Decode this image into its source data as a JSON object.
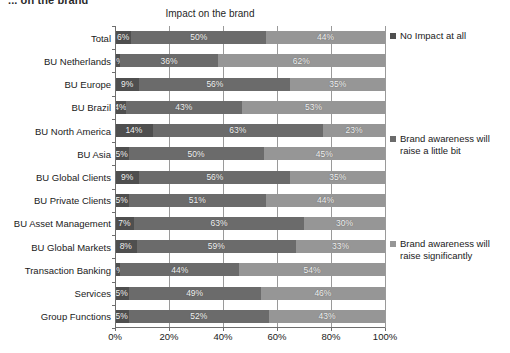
{
  "slide": {
    "header": "... on the brand"
  },
  "chart_data": {
    "type": "bar",
    "subtype": "stacked-horizontal-100",
    "title": "Impact on the brand",
    "xlabel": "",
    "ylabel": "",
    "xlim": [
      0,
      100
    ],
    "xticks": [
      "0%",
      "20%",
      "40%",
      "60%",
      "80%",
      "100%"
    ],
    "xtick_values": [
      0,
      20,
      40,
      60,
      80,
      100
    ],
    "grid": true,
    "legend_position": "right",
    "categories": [
      "Total",
      "BU Netherlands",
      "BU Europe",
      "BU Brazil",
      "BU North America",
      "BU Asia",
      "BU Global Clients",
      "BU Private Clients",
      "BU Asset Management",
      "BU Global Markets",
      "Transaction Banking",
      "Services",
      "Group Functions"
    ],
    "series": [
      {
        "name": "No Impact at all",
        "color": "#4f4f4f",
        "values": [
          6,
          2,
          9,
          4,
          14,
          5,
          9,
          5,
          7,
          8,
          2,
          5,
          5
        ],
        "labels": [
          "6%",
          "2%",
          "9%",
          "4%",
          "14%",
          "5%",
          "9%",
          "5%",
          "7%",
          "8%",
          "2%",
          "5%",
          "5%"
        ]
      },
      {
        "name": "Brand awareness will raise a little bit",
        "color": "#6b6b6b",
        "values": [
          50,
          36,
          56,
          43,
          63,
          50,
          56,
          51,
          63,
          59,
          44,
          49,
          52
        ],
        "labels": [
          "50%",
          "36%",
          "56%",
          "43%",
          "63%",
          "50%",
          "56%",
          "51%",
          "63%",
          "59%",
          "44%",
          "49%",
          "52%"
        ]
      },
      {
        "name": "Brand awareness will raise significantly",
        "color": "#969696",
        "values": [
          44,
          62,
          35,
          53,
          23,
          45,
          35,
          44,
          30,
          33,
          54,
          46,
          43
        ],
        "labels": [
          "44%",
          "62%",
          "35%",
          "53%",
          "23%",
          "45%",
          "35%",
          "44%",
          "30%",
          "33%",
          "54%",
          "46%",
          "43%"
        ]
      }
    ]
  },
  "legend": {
    "items": [
      {
        "label": "No Impact at all",
        "color": "#4f4f4f"
      },
      {
        "label": "Brand awareness will raise a little bit",
        "color": "#6b6b6b"
      },
      {
        "label": "Brand awareness will raise significantly",
        "color": "#969696"
      }
    ]
  }
}
